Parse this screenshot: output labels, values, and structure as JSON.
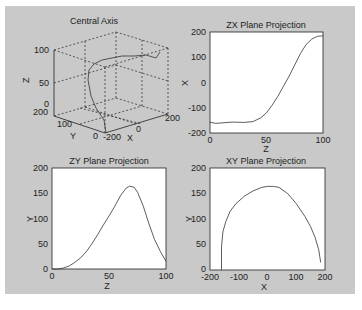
{
  "figure": {
    "background": "#c9c9c9",
    "caption": ""
  },
  "chart_data": [
    {
      "type": "line",
      "subtype": "3d-line",
      "title": "Central Axis",
      "xlabel": "X",
      "ylabel": "Y",
      "zlabel": "Z",
      "xlim": [
        -200,
        200
      ],
      "ylim": [
        0,
        200
      ],
      "zlim": [
        0,
        100
      ],
      "xticks": [
        "-200",
        "0",
        "200"
      ],
      "yticks": [
        "0",
        "100",
        "200"
      ],
      "zticks": [
        "0",
        "50",
        "100"
      ],
      "grid": true,
      "series": [
        {
          "name": "central axis",
          "note": "3D curve whose projections are shown in the other panels"
        }
      ]
    },
    {
      "type": "line",
      "title": "ZX Plane Projection",
      "xlabel": "Z",
      "ylabel": "X",
      "xlim": [
        0,
        100
      ],
      "ylim": [
        -200,
        200
      ],
      "xticks": [
        "0",
        "50",
        "100"
      ],
      "yticks": [
        "-200",
        "-100",
        "0",
        "100",
        "200"
      ],
      "grid": false,
      "x": [
        0,
        5,
        10,
        20,
        30,
        38,
        45,
        50,
        55,
        60,
        65,
        70,
        75,
        80,
        85,
        90,
        95,
        100
      ],
      "values": [
        -157,
        -162,
        -160,
        -157,
        -158,
        -155,
        -140,
        -120,
        -90,
        -55,
        -15,
        25,
        70,
        115,
        150,
        172,
        183,
        185
      ]
    },
    {
      "type": "line",
      "title": "ZY Plane Projection",
      "xlabel": "Z",
      "ylabel": "Y",
      "xlim": [
        0,
        100
      ],
      "ylim": [
        0,
        200
      ],
      "xticks": [
        "0",
        "50",
        "100"
      ],
      "yticks": [
        "0",
        "50",
        "100",
        "150",
        "200"
      ],
      "grid": false,
      "x": [
        0,
        5,
        10,
        15,
        20,
        25,
        30,
        35,
        40,
        45,
        50,
        55,
        60,
        65,
        68,
        72,
        75,
        80,
        85,
        90,
        95,
        100
      ],
      "values": [
        0,
        0,
        2,
        6,
        13,
        22,
        34,
        50,
        68,
        87,
        105,
        124,
        145,
        160,
        164,
        162,
        152,
        125,
        90,
        58,
        35,
        15
      ]
    },
    {
      "type": "line",
      "title": "XY Plane Projection",
      "xlabel": "X",
      "ylabel": "Y",
      "xlim": [
        -200,
        200
      ],
      "ylim": [
        0,
        200
      ],
      "xticks": [
        "-200",
        "-100",
        "0",
        "100",
        "200"
      ],
      "yticks": [
        "0",
        "50",
        "100",
        "150",
        "200"
      ],
      "grid": false,
      "x": [
        -160,
        -160,
        -155,
        -145,
        -130,
        -110,
        -80,
        -50,
        -20,
        0,
        20,
        40,
        70,
        100,
        130,
        150,
        165,
        178,
        185
      ],
      "values": [
        0,
        45,
        75,
        95,
        115,
        130,
        145,
        155,
        162,
        164,
        164,
        162,
        150,
        130,
        105,
        85,
        65,
        40,
        15
      ]
    }
  ]
}
